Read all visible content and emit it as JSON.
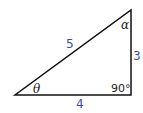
{
  "diagram": {
    "type": "right-triangle",
    "sides": {
      "hypotenuse": "5",
      "vertical": "3",
      "base": "4"
    },
    "angles": {
      "bottom_left": "θ",
      "top_right": "α",
      "right_angle": "90°"
    },
    "colors": {
      "side_labels": "#3a4fa8",
      "lines": "#111111"
    }
  }
}
